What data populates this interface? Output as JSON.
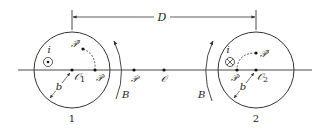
{
  "diagram": {
    "dimension": {
      "label": "D"
    },
    "axis_points": {
      "P": "𝒫",
      "O": "𝒪"
    },
    "loop1": {
      "number_label": "1",
      "center_label": "𝒪",
      "center_subscript": "1",
      "radius_label": "b",
      "current_label": "i",
      "current_symbol": "out-of-page dot",
      "point_prime": "𝒫′",
      "point_double_prime": "𝒫″",
      "field_label": "B"
    },
    "loop2": {
      "number_label": "2",
      "center_label": "𝒪",
      "center_subscript": "2",
      "radius_label": "b",
      "current_label": "i",
      "current_symbol": "into-page cross",
      "point_prime": "𝒫′",
      "point_double_prime": "𝒫″",
      "field_label": "B"
    },
    "colors": {
      "ink": "#222222",
      "background": "#ffffff"
    }
  }
}
